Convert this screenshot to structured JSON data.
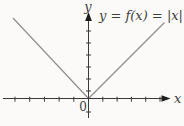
{
  "figure": {
    "background": "#fbfaf8",
    "axis_color": "#3a3a3a",
    "arrow_color": "#1c1c1c",
    "curve_color": "#8f8f8f",
    "text_color": "#3f3f3f",
    "equation_label": "y = f(x) = |x|",
    "x_axis_label": "x",
    "y_axis_label": "y",
    "origin_label": "0"
  },
  "chart_data": {
    "type": "line",
    "title": "y = f(x) = |x|",
    "xlabel": "x",
    "ylabel": "y",
    "series": [
      {
        "name": "f(x) = |x|",
        "x": [
          -5,
          -4,
          -3,
          -2,
          -1,
          0,
          1,
          2,
          3,
          4,
          5
        ],
        "values": [
          5,
          4,
          3,
          2,
          1,
          0,
          1,
          2,
          3,
          4,
          5
        ]
      }
    ],
    "xlim": [
      -5.8,
      5.6
    ],
    "ylim": [
      -1.2,
      7
    ],
    "grid": false,
    "legend_position": "none",
    "tick_labels_shown": [
      "0"
    ],
    "annotations": [
      "y = f(x) = |x|"
    ],
    "axis_ticks": {
      "x_left_count": 5,
      "x_right_count": 5,
      "y_up_count": 6,
      "y_down_count": 1
    }
  }
}
